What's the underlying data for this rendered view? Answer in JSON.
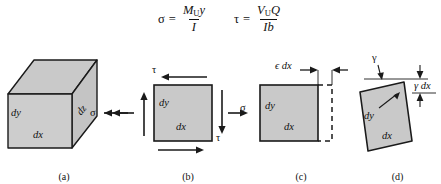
{
  "figure": {
    "caption_note": "Stress and strain on a differential element",
    "fill_color": "#c9c9c9",
    "stroke_color": "#1a1a1a",
    "background": "#ffffff"
  },
  "formulas": [
    {
      "id": "normal-stress",
      "lhs": "σ",
      "relation": "=",
      "numerator_main": "M",
      "numerator_sub": "U",
      "numerator_tail": "y",
      "denominator": "I"
    },
    {
      "id": "shear-stress",
      "lhs": "τ",
      "relation": "=",
      "numerator_main": "V",
      "numerator_sub": "U",
      "numerator_tail": "Q",
      "denominator": "Ib"
    }
  ],
  "panels": [
    {
      "id": "a",
      "caption": "(a)",
      "description": "three-dimensional differential cube element",
      "labels": {
        "dy": "dy",
        "dx": "dx",
        "dz": "dz",
        "sigma": "σ"
      },
      "arrows": [
        {
          "name": "sigma-arrow-left",
          "direction": "left"
        }
      ]
    },
    {
      "id": "b",
      "caption": "(b)",
      "description": "two-dimensional element with shear and normal stresses",
      "labels": {
        "dy": "dy",
        "dx": "dx",
        "sigma_left": "σ",
        "sigma_right": "σ",
        "tau_top": "τ",
        "tau_right": "τ"
      },
      "arrows": [
        {
          "name": "tau-arrow-top",
          "direction": "left"
        },
        {
          "name": "tau-arrow-bottom",
          "direction": "right"
        },
        {
          "name": "tau-arrow-left",
          "direction": "up"
        },
        {
          "name": "tau-arrow-right",
          "direction": "down"
        },
        {
          "name": "sigma-arrow-left",
          "direction": "left"
        },
        {
          "name": "sigma-arrow-right",
          "direction": "right"
        }
      ]
    },
    {
      "id": "c",
      "caption": "(c)",
      "description": "normal strain elongation of the element",
      "labels": {
        "dy": "dy",
        "dx": "dx",
        "epsilon_dx": "ϵ dx"
      }
    },
    {
      "id": "d",
      "caption": "(d)",
      "description": "shear strain distortion of the element",
      "labels": {
        "dy": "dy",
        "dx": "dx",
        "gamma": "γ",
        "gamma_dx": "γ dx"
      }
    }
  ]
}
